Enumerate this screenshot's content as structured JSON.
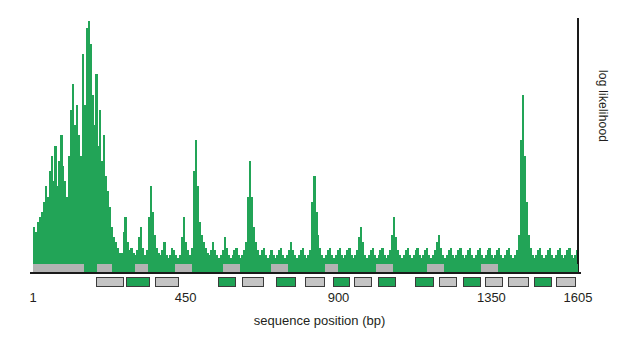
{
  "chart_data": {
    "type": "bar",
    "title": "",
    "xlabel": "sequence position (bp)",
    "ylabel": "log likelihood",
    "xlim": [
      1,
      1605
    ],
    "ylim": [
      0,
      100
    ],
    "grid": false,
    "legend": null,
    "xticks": [
      {
        "value": 1,
        "label": "1"
      },
      {
        "value": 450,
        "label": "450"
      },
      {
        "value": 900,
        "label": "900"
      },
      {
        "value": 1350,
        "label": "1350"
      },
      {
        "value": 1605,
        "label": "1605"
      }
    ],
    "yticks": [],
    "colors": {
      "grey_series": "#b3b3b3",
      "green_series": "#22a457",
      "axis": "#1a1a1a"
    },
    "x_step_bp": 9.6,
    "series": [
      {
        "name": "grey",
        "color": "#b3b3b3",
        "values": [
          14,
          14,
          14,
          14,
          16,
          18,
          22,
          20,
          26,
          30,
          24,
          34,
          22,
          30,
          36,
          28,
          24,
          20,
          30,
          44,
          52,
          40,
          46,
          38,
          32,
          60,
          46,
          70,
          86,
          62,
          48,
          40,
          56,
          34,
          44,
          30,
          38,
          26,
          22,
          18,
          12,
          10,
          8,
          7,
          6,
          6,
          10,
          14,
          8,
          6,
          7,
          6,
          5,
          6,
          9,
          12,
          7,
          5,
          6,
          14,
          22,
          16,
          10,
          7,
          6,
          5,
          6,
          8,
          5,
          4,
          5,
          7,
          6,
          5,
          4,
          5,
          9,
          14,
          8,
          6,
          5,
          7,
          26,
          34,
          22,
          14,
          10,
          8,
          7,
          6,
          5,
          6,
          8,
          6,
          5,
          4,
          5,
          6,
          9,
          7,
          5,
          4,
          5,
          6,
          7,
          5,
          4,
          5,
          6,
          8,
          20,
          28,
          20,
          12,
          8,
          6,
          5,
          6,
          7,
          5,
          4,
          5,
          6,
          5,
          4,
          5,
          6,
          7,
          5,
          4,
          5,
          6,
          8,
          6,
          5,
          4,
          5,
          6,
          7,
          5,
          4,
          5,
          6,
          18,
          24,
          16,
          10,
          7,
          5,
          4,
          5,
          6,
          7,
          5,
          4,
          5,
          6,
          7,
          5,
          4,
          5,
          6,
          7,
          5,
          4,
          5,
          6,
          9,
          12,
          8,
          5,
          4,
          5,
          6,
          7,
          5,
          4,
          5,
          6,
          7,
          5,
          4,
          5,
          6,
          10,
          14,
          9,
          6,
          5,
          4,
          5,
          6,
          7,
          5,
          4,
          5,
          6,
          7,
          5,
          4,
          5,
          6,
          7,
          5,
          4,
          5,
          6,
          8,
          10,
          7,
          5,
          4,
          5,
          6,
          7,
          5,
          4,
          5,
          6,
          7,
          5,
          4,
          5,
          6,
          7,
          5,
          4,
          5,
          6,
          7,
          5,
          4,
          5,
          6,
          7,
          5,
          4,
          5,
          6,
          7,
          5,
          4,
          5,
          6,
          7,
          5,
          4,
          5,
          6,
          10,
          34,
          46,
          30,
          18,
          10,
          7,
          5,
          4,
          5,
          6,
          7,
          5,
          4,
          5,
          6,
          7,
          5,
          4,
          5,
          6,
          7,
          5,
          4,
          5,
          6,
          7,
          5,
          4,
          5,
          6
        ]
      },
      {
        "name": "green",
        "color": "#22a457",
        "values": [
          18,
          16,
          20,
          22,
          24,
          28,
          34,
          30,
          40,
          46,
          36,
          50,
          34,
          44,
          54,
          42,
          36,
          30,
          46,
          64,
          74,
          58,
          66,
          54,
          46,
          86,
          66,
          96,
          99,
          90,
          70,
          58,
          78,
          50,
          64,
          44,
          54,
          38,
          32,
          26,
          18,
          14,
          12,
          10,
          8,
          8,
          16,
          22,
          12,
          9,
          10,
          8,
          7,
          9,
          14,
          18,
          10,
          7,
          9,
          22,
          34,
          24,
          15,
          10,
          8,
          7,
          9,
          12,
          7,
          6,
          7,
          10,
          9,
          7,
          6,
          7,
          14,
          22,
          12,
          9,
          7,
          10,
          40,
          52,
          34,
          20,
          15,
          12,
          10,
          8,
          7,
          9,
          12,
          9,
          7,
          6,
          7,
          9,
          14,
          10,
          7,
          6,
          7,
          9,
          10,
          7,
          6,
          7,
          9,
          12,
          30,
          44,
          30,
          18,
          12,
          9,
          7,
          9,
          10,
          7,
          6,
          7,
          9,
          7,
          6,
          7,
          9,
          10,
          7,
          6,
          7,
          9,
          12,
          9,
          7,
          6,
          7,
          9,
          10,
          7,
          6,
          7,
          9,
          28,
          38,
          24,
          15,
          10,
          7,
          6,
          7,
          9,
          10,
          7,
          6,
          7,
          9,
          10,
          7,
          6,
          7,
          9,
          10,
          7,
          6,
          7,
          9,
          14,
          18,
          12,
          7,
          6,
          7,
          9,
          10,
          7,
          6,
          7,
          9,
          10,
          7,
          6,
          7,
          9,
          15,
          22,
          14,
          9,
          7,
          6,
          7,
          9,
          10,
          7,
          6,
          7,
          9,
          10,
          7,
          6,
          7,
          9,
          10,
          7,
          6,
          7,
          9,
          12,
          15,
          10,
          7,
          6,
          7,
          9,
          10,
          7,
          6,
          7,
          9,
          10,
          7,
          6,
          7,
          9,
          10,
          7,
          6,
          7,
          9,
          10,
          7,
          6,
          7,
          9,
          10,
          7,
          6,
          7,
          9,
          10,
          7,
          6,
          7,
          9,
          10,
          7,
          6,
          7,
          9,
          15,
          52,
          70,
          46,
          28,
          15,
          10,
          7,
          6,
          7,
          9,
          10,
          7,
          6,
          7,
          9,
          10,
          7,
          6,
          7,
          9,
          10,
          7,
          6,
          7,
          9,
          10,
          7,
          6,
          7,
          9
        ]
      }
    ],
    "annotation_strip": [
      {
        "start": 1,
        "end": 150,
        "fill": "grey"
      },
      {
        "start": 150,
        "end": 190,
        "fill": "green"
      },
      {
        "start": 190,
        "end": 235,
        "fill": "grey"
      },
      {
        "start": 235,
        "end": 300,
        "fill": "green"
      },
      {
        "start": 300,
        "end": 340,
        "fill": "grey"
      },
      {
        "start": 340,
        "end": 420,
        "fill": "green"
      },
      {
        "start": 420,
        "end": 470,
        "fill": "grey"
      },
      {
        "start": 470,
        "end": 560,
        "fill": "green"
      },
      {
        "start": 560,
        "end": 610,
        "fill": "grey"
      },
      {
        "start": 610,
        "end": 700,
        "fill": "green"
      },
      {
        "start": 700,
        "end": 750,
        "fill": "grey"
      },
      {
        "start": 750,
        "end": 860,
        "fill": "green"
      },
      {
        "start": 860,
        "end": 900,
        "fill": "grey"
      },
      {
        "start": 900,
        "end": 1010,
        "fill": "green"
      },
      {
        "start": 1010,
        "end": 1060,
        "fill": "grey"
      },
      {
        "start": 1060,
        "end": 1160,
        "fill": "green"
      },
      {
        "start": 1160,
        "end": 1210,
        "fill": "grey"
      },
      {
        "start": 1210,
        "end": 1320,
        "fill": "green"
      },
      {
        "start": 1320,
        "end": 1370,
        "fill": "grey"
      },
      {
        "start": 1370,
        "end": 1500,
        "fill": "green"
      },
      {
        "start": 1500,
        "end": 1605,
        "fill": "green"
      }
    ],
    "annotation_boxes": [
      {
        "start": 185,
        "end": 270,
        "fill": "grey"
      },
      {
        "start": 275,
        "end": 345,
        "fill": "green"
      },
      {
        "start": 360,
        "end": 430,
        "fill": "grey"
      },
      {
        "start": 545,
        "end": 600,
        "fill": "green"
      },
      {
        "start": 615,
        "end": 680,
        "fill": "grey"
      },
      {
        "start": 715,
        "end": 775,
        "fill": "green"
      },
      {
        "start": 800,
        "end": 860,
        "fill": "grey"
      },
      {
        "start": 885,
        "end": 935,
        "fill": "green"
      },
      {
        "start": 945,
        "end": 1000,
        "fill": "grey"
      },
      {
        "start": 1015,
        "end": 1070,
        "fill": "green"
      },
      {
        "start": 1125,
        "end": 1180,
        "fill": "green"
      },
      {
        "start": 1195,
        "end": 1250,
        "fill": "grey"
      },
      {
        "start": 1265,
        "end": 1320,
        "fill": "green"
      },
      {
        "start": 1330,
        "end": 1385,
        "fill": "grey"
      },
      {
        "start": 1400,
        "end": 1460,
        "fill": "grey"
      },
      {
        "start": 1475,
        "end": 1530,
        "fill": "green"
      },
      {
        "start": 1540,
        "end": 1600,
        "fill": "grey"
      }
    ]
  }
}
